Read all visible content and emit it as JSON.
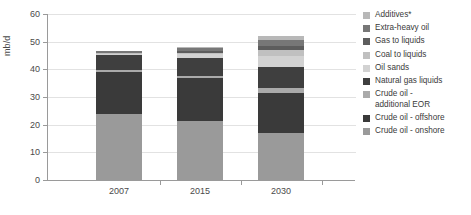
{
  "chart_data": {
    "type": "bar",
    "stacked": true,
    "title": "",
    "xlabel": "",
    "ylabel": "mb/d",
    "ylim": [
      0,
      60
    ],
    "yticks": [
      0,
      10,
      20,
      30,
      40,
      50,
      60
    ],
    "grid": true,
    "legend_position": "right",
    "categories": [
      "2007",
      "2015",
      "2030"
    ],
    "series": [
      {
        "name": "Crude oil - onshore",
        "color": "#9a9a9a",
        "values": [
          23.9,
          21.3,
          17.0
        ]
      },
      {
        "name": "Crude oil - offshore",
        "color": "#3a3a3a",
        "values": [
          15.1,
          15.7,
          14.3
        ]
      },
      {
        "name": "Crude oil - additional EOR",
        "color": "#aaaaaa",
        "values": [
          0.6,
          0.6,
          2.0
        ]
      },
      {
        "name": "Natural gas liquids",
        "color": "#3f3f3f",
        "values": [
          5.5,
          6.5,
          7.4
        ]
      },
      {
        "name": "Oil sands",
        "color": "#d2d2d2",
        "values": [
          0.5,
          1.3,
          4.0
        ]
      },
      {
        "name": "Coal to liquids",
        "color": "#c0c0c0",
        "values": [
          0.2,
          0.6,
          2.3
        ]
      },
      {
        "name": "Gas to liquids",
        "color": "#5d5d5d",
        "values": [
          0.2,
          0.8,
          1.5
        ]
      },
      {
        "name": "Extra-heavy oil",
        "color": "#777777",
        "values": [
          0.5,
          0.9,
          2.0
        ]
      },
      {
        "name": "Additives*",
        "color": "#b8b8b8",
        "values": [
          0.3,
          0.4,
          1.5
        ]
      }
    ],
    "totals": [
      46.8,
      48.1,
      52.0
    ]
  },
  "legend": {
    "items": [
      {
        "label": "Additives*",
        "color": "#b8b8b8"
      },
      {
        "label": "Extra-heavy oil",
        "color": "#777777"
      },
      {
        "label": "Gas to liquids",
        "color": "#5d5d5d"
      },
      {
        "label": "Coal to liquids",
        "color": "#c0c0c0"
      },
      {
        "label": "Oil sands",
        "color": "#d2d2d2"
      },
      {
        "label": "Natural gas liquids",
        "color": "#3f3f3f"
      },
      {
        "label": "Crude oil -\nadditional EOR",
        "color": "#aaaaaa"
      },
      {
        "label": "Crude oil - offshore",
        "color": "#3a3a3a"
      },
      {
        "label": "Crude oil - onshore",
        "color": "#9a9a9a"
      }
    ]
  },
  "axes": {
    "y_title": "mb/d",
    "y_tick_labels": [
      "0",
      "10",
      "20",
      "30",
      "40",
      "50",
      "60"
    ],
    "x_tick_labels": [
      "2007",
      "2015",
      "2030"
    ]
  },
  "colors": {
    "axis": "#9a9a9a",
    "grid": "#e2e2e2",
    "text": "#3a3a3a",
    "background": "#ffffff"
  }
}
